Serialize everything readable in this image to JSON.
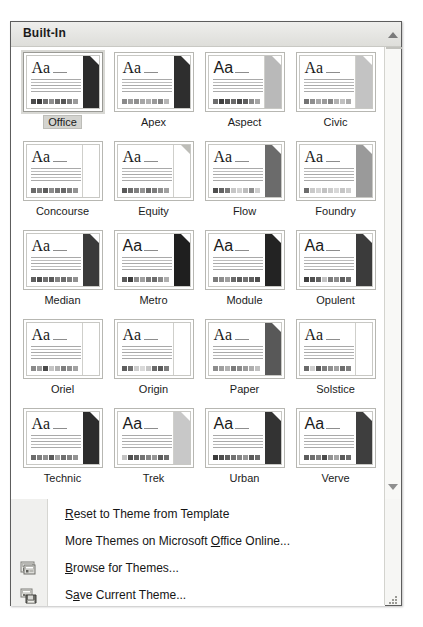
{
  "gallery": {
    "header_title": "Built-In",
    "scroll_up_icon": "triangle-up-icon",
    "scroll_down_icon": "triangle-down-icon",
    "resize_handle_icon": "resize-grip-icon",
    "selected_theme": "Office",
    "themes": [
      {
        "name": "Office",
        "font": "serif",
        "accent": "#2b2b2b",
        "accent_light": false,
        "fold": "light",
        "swatches": [
          "#4d4d4d",
          "#3c3c3c",
          "#707070",
          "#8e8e8e",
          "#6a6a6a",
          "#575757",
          "#7e7e7e",
          "#9b9b9b"
        ]
      },
      {
        "name": "Apex",
        "font": "serif",
        "accent": "#2e2e2e",
        "accent_light": false,
        "fold": "light",
        "swatches": [
          "#8a8a8a",
          "#9c9c9c",
          "#8f8f8f",
          "#a6a6a6",
          "#b0b0b0",
          "#9a9a9a",
          "#848484",
          "#b6b6b6"
        ]
      },
      {
        "name": "Aspect",
        "font": "sans",
        "accent": "#b9b9b9",
        "accent_light": true,
        "fold": "light",
        "swatches": [
          "#6f6f6f",
          "#3f3f3f",
          "#555555",
          "#6b6b6b",
          "#4a4a4a",
          "#5f5f5f",
          "#8b8b8b",
          "#a4a4a4"
        ]
      },
      {
        "name": "Civic",
        "font": "serif",
        "accent": "#c3c3c3",
        "accent_light": true,
        "fold": "light",
        "swatches": [
          "#747474",
          "#8f8f8f",
          "#a8a8a8",
          "#9b9b9b",
          "#868686",
          "#b2b2b2",
          "#c0c0c0",
          "#ababab"
        ]
      },
      {
        "name": "Concourse",
        "font": "serif",
        "accent": "#ffffff",
        "accent_light": true,
        "fold": "light",
        "swatches": [
          "#6b6b6b",
          "#7d7d7d",
          "#5d5d5d",
          "#8b8b8b",
          "#757575",
          "#696969",
          "#7f7f7f",
          "#939393"
        ]
      },
      {
        "name": "Equity",
        "font": "serif",
        "accent": "#ffffff",
        "accent_light": true,
        "fold": "dark",
        "swatches": [
          "#5a5a5a",
          "#6e6e6e",
          "#818181",
          "#939393",
          "#6a6a6a",
          "#7c7c7c",
          "#8f8f8f",
          "#a1a1a1"
        ]
      },
      {
        "name": "Flow",
        "font": "serif",
        "accent": "#6b6b6b",
        "accent_light": false,
        "fold": "light",
        "swatches": [
          "#4f4f4f",
          "#636363",
          "#7a7a7a",
          "#c6c6c6",
          "#d2d2d2",
          "#bcbcbc",
          "#8e8e8e",
          "#cfcfcf"
        ]
      },
      {
        "name": "Foundry",
        "font": "serif",
        "accent": "#9a9a9a",
        "accent_light": false,
        "fold": "light",
        "swatches": [
          "#6d6d6d",
          "#c9c9c9",
          "#d4d4d4",
          "#c2c2c2",
          "#cccccc",
          "#d8d8d8",
          "#c5c5c5",
          "#d0d0d0"
        ]
      },
      {
        "name": "Median",
        "font": "serif",
        "accent": "#3a3a3a",
        "accent_light": false,
        "fold": "light",
        "swatches": [
          "#606060",
          "#4e4e4e",
          "#727272",
          "#5a5a5a",
          "#848484",
          "#6c6c6c",
          "#7e7e7e",
          "#909090"
        ]
      },
      {
        "name": "Metro",
        "font": "sans",
        "accent": "#1f1f1f",
        "accent_light": false,
        "fold": "light",
        "swatches": [
          "#5b5b5b",
          "#3d3d3d",
          "#8d8d8d",
          "#9f9f9f",
          "#7a7a7a",
          "#6c6c6c",
          "#8a8a8a",
          "#afafaf"
        ]
      },
      {
        "name": "Module",
        "font": "sans",
        "accent": "#232323",
        "accent_light": false,
        "fold": "light",
        "swatches": [
          "#7b7b7b",
          "#8d8d8d",
          "#9f9f9f",
          "#6a6a6a",
          "#5c5c5c",
          "#727272",
          "#5f5f5f",
          "#4d4d4d"
        ]
      },
      {
        "name": "Opulent",
        "font": "sans",
        "accent": "#3b3b3b",
        "accent_light": false,
        "fold": "light",
        "swatches": [
          "#3f3f3f",
          "#515151",
          "#636363",
          "#c2c2c2",
          "#7a7a7a",
          "#8c8c8c",
          "#5d5d5d",
          "#6f6f6f"
        ]
      },
      {
        "name": "Oriel",
        "font": "serif",
        "accent": "#ffffff",
        "accent_light": true,
        "fold": "light",
        "swatches": [
          "#8a8a8a",
          "#9c9c9c",
          "#4a4a4a",
          "#c4c4c4",
          "#b0b0b0",
          "#7e7e7e",
          "#909090",
          "#a2a2a2"
        ]
      },
      {
        "name": "Origin",
        "font": "serif",
        "accent": "#ffffff",
        "accent_light": true,
        "fold": "light",
        "swatches": [
          "#5f5f5f",
          "#717171",
          "#cdcdcd",
          "#d9d9d9",
          "#c5c5c5",
          "#6b6b6b",
          "#5a5a5a",
          "#7d7d7d"
        ]
      },
      {
        "name": "Paper",
        "font": "serif",
        "accent": "#585858",
        "accent_light": false,
        "fold": "light",
        "swatches": [
          "#8d8d8d",
          "#9f9f9f",
          "#b1b1b1",
          "#7b7b7b",
          "#8a8a8a",
          "#9c9c9c",
          "#aeaeae",
          "#c0c0c0"
        ]
      },
      {
        "name": "Solstice",
        "font": "serif",
        "accent": "#ffffff",
        "accent_light": true,
        "fold": "light",
        "swatches": [
          "#6a6a6a",
          "#cfcfcf",
          "#5b5b5b",
          "#7d7d7d",
          "#8f8f8f",
          "#a1a1a1",
          "#6e6e6e",
          "#808080"
        ]
      },
      {
        "name": "Technic",
        "font": "serif",
        "accent": "#2c2c2c",
        "accent_light": false,
        "fold": "light",
        "swatches": [
          "#6c6c6c",
          "#7e7e7e",
          "#909090",
          "#5a5a5a",
          "#a2a2a2",
          "#6f6f6f",
          "#818181",
          "#939393"
        ]
      },
      {
        "name": "Trek",
        "font": "sans",
        "accent": "#c8c8c8",
        "accent_light": true,
        "fold": "light",
        "swatches": [
          "#c3c3c3",
          "#4f4f4f",
          "#616161",
          "#737373",
          "#858585",
          "#979797",
          "#5c5c5c",
          "#6e6e6e"
        ]
      },
      {
        "name": "Urban",
        "font": "sans",
        "accent": "#333333",
        "accent_light": false,
        "fold": "light",
        "swatches": [
          "#3c3c3c",
          "#4e4e4e",
          "#606060",
          "#727272",
          "#848484",
          "#969696",
          "#5a5a5a",
          "#6c6c6c"
        ]
      },
      {
        "name": "Verve",
        "font": "sans",
        "accent": "#3e3e3e",
        "accent_light": false,
        "fold": "light",
        "swatches": [
          "#5d5d5d",
          "#6f6f6f",
          "#818181",
          "#4b4b4b",
          "#939393",
          "#a5a5a5",
          "#5a5a5a",
          "#6c6c6c"
        ]
      }
    ]
  },
  "menu": {
    "items": [
      {
        "pre": "",
        "accel": "R",
        "post": "eset to Theme from Template",
        "icon": null
      },
      {
        "pre": "More Themes on Microsoft ",
        "accel": "O",
        "post": "ffice Online...",
        "icon": null
      },
      {
        "pre": "",
        "accel": "B",
        "post": "rowse for Themes...",
        "icon": "browse-themes-icon"
      },
      {
        "pre": "S",
        "accel": "a",
        "post": "ve Current Theme...",
        "icon": "save-theme-icon"
      }
    ]
  },
  "colors": {
    "popup_border": "#5d5d5d",
    "header_bg": "#e3e3df",
    "selection_bg": "#d4d4d0",
    "text": "#151515"
  }
}
